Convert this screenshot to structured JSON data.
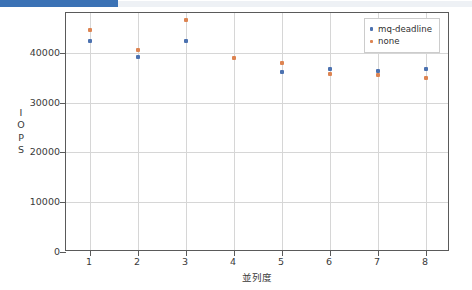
{
  "window": {
    "chrome_strip_color": "#3b72b5"
  },
  "chart_data": {
    "type": "scatter",
    "title": "",
    "xlabel": "並列度",
    "ylabel": "IOPS",
    "ylabel_chars": [
      "I",
      "O",
      "P",
      "S"
    ],
    "x": [
      1,
      2,
      3,
      4,
      5,
      6,
      7,
      8
    ],
    "xlim": [
      0.5,
      8.5
    ],
    "ylim": [
      0,
      48000
    ],
    "ytick_labels": [
      "0",
      "10000",
      "20000",
      "30000",
      "40000"
    ],
    "ytick_values": [
      0,
      10000,
      20000,
      30000,
      40000
    ],
    "xtick_labels": [
      "1",
      "2",
      "3",
      "4",
      "5",
      "6",
      "7",
      "8"
    ],
    "grid": true,
    "legend_position": "upper right",
    "series": [
      {
        "name": "mq-deadline",
        "color": "#4c72b0",
        "x": [
          1,
          2,
          3,
          5,
          6,
          7,
          8
        ],
        "values": [
          42400,
          39200,
          42300,
          36100,
          36700,
          36300,
          36700
        ]
      },
      {
        "name": "none",
        "color": "#dd8452",
        "x": [
          1,
          2,
          3,
          4,
          5,
          6,
          7,
          8
        ],
        "values": [
          44500,
          40600,
          46600,
          39000,
          38000,
          35700,
          35600,
          34900
        ]
      }
    ]
  }
}
